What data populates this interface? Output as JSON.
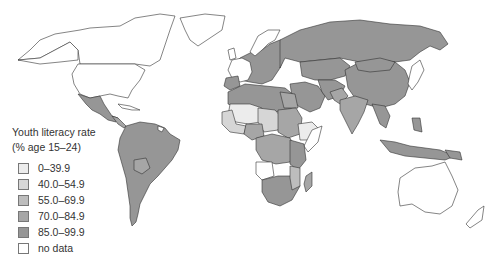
{
  "legend": {
    "title_line1": "Youth literacy rate",
    "title_line2": "(% age 15–24)",
    "items": [
      {
        "label": "0–39.9",
        "color": "#ececec"
      },
      {
        "label": "40.0–54.9",
        "color": "#d6d6d6"
      },
      {
        "label": "55.0–69.9",
        "color": "#bdbdbd"
      },
      {
        "label": "70.0–84.9",
        "color": "#a6a6a6"
      },
      {
        "label": "85.0–99.9",
        "color": "#969696"
      },
      {
        "label": "no data",
        "color": "#ffffff"
      }
    ]
  },
  "map": {
    "colors": {
      "no_data": "#ffffff",
      "c0": "#ececec",
      "c40": "#d6d6d6",
      "c55": "#bdbdbd",
      "c70": "#a6a6a6",
      "c85": "#969696",
      "border": "#333333"
    }
  }
}
